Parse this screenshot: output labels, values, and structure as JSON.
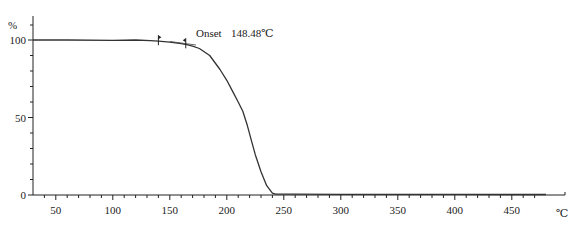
{
  "chart_data": {
    "type": "line",
    "title": "",
    "xlabel": "°C",
    "ylabel": "%",
    "xlim": [
      30,
      480
    ],
    "ylim": [
      0,
      115
    ],
    "grid": false,
    "legend": null,
    "x_ticks": [
      50,
      100,
      150,
      200,
      250,
      300,
      350,
      400,
      450
    ],
    "x_unit_label": "℃",
    "y_ticks": [
      0,
      50,
      100
    ],
    "y_unit_label": "%",
    "series": [
      {
        "name": "TG",
        "color": "#333333",
        "x": [
          30,
          60,
          100,
          120,
          133,
          140,
          150,
          160,
          165,
          170,
          176,
          185,
          194,
          200,
          205,
          210,
          214,
          218,
          222,
          225,
          230,
          235,
          240,
          243,
          248,
          260,
          300,
          350,
          400,
          450,
          480
        ],
        "y": [
          100,
          100,
          99.8,
          100,
          99.6,
          99.2,
          98.6,
          97.6,
          97,
          96,
          94.5,
          90,
          81,
          74,
          67,
          60,
          54,
          45,
          34,
          26,
          15,
          6,
          1.2,
          0.6,
          0.5,
          0.5,
          0.4,
          0.4,
          0.4,
          0.3,
          0.3
        ]
      }
    ],
    "annotations": [
      {
        "text": "Onset",
        "value": "148.48℃",
        "x": 148.48
      }
    ],
    "markers": [
      {
        "x": 140,
        "y": 99.2,
        "type": "start-marker"
      },
      {
        "x": 164,
        "y": 97.2,
        "type": "end-marker"
      }
    ]
  },
  "annotation": {
    "onset_label": "Onset",
    "onset_value": "148.48℃"
  },
  "axes": {
    "x_unit": "℃",
    "y_unit": "%"
  }
}
